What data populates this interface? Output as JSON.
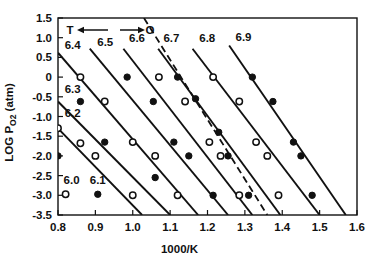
{
  "figure": {
    "name": "log-po2-vs-inverse-temperature-plot",
    "background": "#ffffff",
    "ink_color": "#111111"
  },
  "annotation": {
    "left_label": "T",
    "right_label": "O",
    "left_arrow_icon": "arrow-left-icon",
    "right_arrow_icon": "arrow-right-icon"
  },
  "legend": {
    "open_marker_label": "6.0",
    "filled_marker_label": "6.1",
    "open_marker_icon": "open-circle-marker",
    "filled_marker_icon": "filled-circle-marker"
  },
  "chart_data": {
    "type": "scatter",
    "title": "",
    "xlabel": "1000/K",
    "ylabel": "LOG PO2 (atm)",
    "xlim": [
      0.8,
      1.6
    ],
    "ylim": [
      -3.5,
      1.5
    ],
    "xticks": [
      "0.8",
      "0.9",
      "1.0",
      "1.1",
      "1.2",
      "1.3",
      "1.4",
      "1.5",
      "1.6"
    ],
    "xtick_values": [
      0.8,
      0.9,
      1.0,
      1.1,
      1.2,
      1.3,
      1.4,
      1.5,
      1.6
    ],
    "yticks": [
      "1.5",
      "1.0",
      "0.5",
      "0",
      "-0.5",
      "-1.0",
      "-1.5",
      "-2.0",
      "-2.5",
      "-3.0",
      "-3.5"
    ],
    "ytick_values": [
      1.5,
      1.0,
      0.5,
      0.0,
      -0.5,
      -1.0,
      -1.5,
      -2.0,
      -2.5,
      -3.0,
      -3.5
    ],
    "grid": false,
    "legend_position": "bottom-left-inside",
    "series": [
      {
        "name": "6.0",
        "label": "6.0",
        "label_x": 0.815,
        "label_y": -2.72,
        "label_anchor": "start",
        "style": "legend-only",
        "marker": "open",
        "line": "none",
        "points": []
      },
      {
        "name": "6.1",
        "label": "6.1",
        "label_x": 0.885,
        "label_y": -2.72,
        "label_anchor": "start",
        "style": "legend-only",
        "marker": "filled",
        "line": "none",
        "points": []
      },
      {
        "name": "6.2",
        "label": "6.2",
        "label_x": 0.818,
        "label_y": -1.02,
        "label_anchor": "start",
        "style": "solid",
        "marker": "open",
        "line": {
          "x1": 0.8,
          "y1": -1.3,
          "x2": 1.025,
          "y2": -3.5
        },
        "points": [
          {
            "x": 0.8,
            "y": -1.3,
            "marker": "open"
          },
          {
            "x": 0.86,
            "y": -1.68,
            "marker": "open"
          },
          {
            "x": 0.9,
            "y": -2.0,
            "marker": "open"
          },
          {
            "x": 1.0,
            "y": -3.0,
            "marker": "open"
          }
        ]
      },
      {
        "name": "6.3",
        "label": "6.3",
        "label_x": 0.818,
        "label_y": -0.4,
        "label_anchor": "start",
        "style": "solid",
        "marker": "filled",
        "line": {
          "x1": 0.8,
          "y1": -0.62,
          "x2": 1.1,
          "y2": -3.5
        },
        "points": [
          {
            "x": 0.8,
            "y": -2.0,
            "marker": "filled"
          },
          {
            "x": 0.86,
            "y": -0.62,
            "marker": "filled"
          },
          {
            "x": 0.925,
            "y": -1.65,
            "marker": "filled"
          },
          {
            "x": 1.06,
            "y": -2.55,
            "marker": "filled"
          }
        ]
      },
      {
        "name": "6.4",
        "label": "6.4",
        "label_x": 0.818,
        "label_y": 0.72,
        "label_anchor": "start",
        "style": "solid",
        "marker": "open",
        "line": {
          "x1": 0.8,
          "y1": 0.62,
          "x2": 1.175,
          "y2": -3.5
        },
        "points": [
          {
            "x": 0.86,
            "y": 0.0,
            "marker": "open"
          },
          {
            "x": 0.925,
            "y": -0.62,
            "marker": "open"
          },
          {
            "x": 1.0,
            "y": -1.65,
            "marker": "open"
          },
          {
            "x": 1.06,
            "y": -2.0,
            "marker": "open"
          },
          {
            "x": 1.12,
            "y": -3.0,
            "marker": "open"
          }
        ]
      },
      {
        "name": "6.5",
        "label": "6.5",
        "label_x": 0.905,
        "label_y": 0.8,
        "label_anchor": "start",
        "style": "solid",
        "marker": "filled",
        "line": {
          "x1": 0.885,
          "y1": 0.72,
          "x2": 1.255,
          "y2": -3.5
        },
        "points": [
          {
            "x": 0.985,
            "y": 0.0,
            "marker": "filled"
          },
          {
            "x": 1.055,
            "y": -0.62,
            "marker": "filled"
          },
          {
            "x": 1.11,
            "y": -1.65,
            "marker": "filled"
          },
          {
            "x": 1.15,
            "y": -2.0,
            "marker": "filled"
          },
          {
            "x": 1.215,
            "y": -3.0,
            "marker": "filled"
          }
        ]
      },
      {
        "name": "6.6",
        "label": "6.6",
        "label_x": 0.99,
        "label_y": 0.88,
        "label_anchor": "start",
        "style": "solid",
        "marker": "open",
        "line": {
          "x1": 0.975,
          "y1": 0.72,
          "x2": 1.32,
          "y2": -3.5
        },
        "points": [
          {
            "x": 1.07,
            "y": 0.0,
            "marker": "open"
          },
          {
            "x": 1.14,
            "y": -0.62,
            "marker": "open"
          },
          {
            "x": 1.205,
            "y": -1.65,
            "marker": "open"
          },
          {
            "x": 1.235,
            "y": -2.0,
            "marker": "open"
          },
          {
            "x": 1.285,
            "y": -3.0,
            "marker": "open"
          }
        ]
      },
      {
        "name": "6.7",
        "label": "6.7",
        "label_x": 1.082,
        "label_y": 0.88,
        "label_anchor": "start",
        "style": "solid",
        "marker": "filled",
        "line": {
          "x1": 1.068,
          "y1": 0.72,
          "x2": 1.395,
          "y2": -3.5
        },
        "points": [
          {
            "x": 1.12,
            "y": 0.0,
            "marker": "filled"
          },
          {
            "x": 1.168,
            "y": -0.55,
            "marker": "filled"
          },
          {
            "x": 1.23,
            "y": -1.4,
            "marker": "filled"
          },
          {
            "x": 1.255,
            "y": -2.0,
            "marker": "filled"
          },
          {
            "x": 1.31,
            "y": -3.0,
            "marker": "filled"
          }
        ]
      },
      {
        "name": "6.8",
        "label": "6.8",
        "label_x": 1.178,
        "label_y": 0.88,
        "label_anchor": "start",
        "style": "solid",
        "marker": "open",
        "line": {
          "x1": 1.16,
          "y1": 0.72,
          "x2": 1.5,
          "y2": -3.5
        },
        "points": [
          {
            "x": 1.215,
            "y": 0.0,
            "marker": "open"
          },
          {
            "x": 1.285,
            "y": -0.62,
            "marker": "open"
          },
          {
            "x": 1.33,
            "y": -1.65,
            "marker": "open"
          },
          {
            "x": 1.36,
            "y": -2.0,
            "marker": "open"
          },
          {
            "x": 1.39,
            "y": -3.0,
            "marker": "open"
          }
        ]
      },
      {
        "name": "6.9",
        "label": "6.9",
        "label_x": 1.275,
        "label_y": 0.92,
        "label_anchor": "start",
        "style": "solid",
        "marker": "filled",
        "line": {
          "x1": 1.258,
          "y1": 0.8,
          "x2": 1.57,
          "y2": -3.5
        },
        "points": [
          {
            "x": 1.32,
            "y": 0.0,
            "marker": "filled"
          },
          {
            "x": 1.375,
            "y": -0.62,
            "marker": "filled"
          },
          {
            "x": 1.43,
            "y": -1.65,
            "marker": "filled"
          },
          {
            "x": 1.45,
            "y": -2.0,
            "marker": "filled"
          },
          {
            "x": 1.48,
            "y": -3.0,
            "marker": "filled"
          }
        ]
      },
      {
        "name": "dashed-boundary",
        "label": "",
        "style": "dashed",
        "marker": "none",
        "line": {
          "x1": 1.03,
          "y1": 1.5,
          "x2": 1.36,
          "y2": -3.5
        },
        "points": []
      }
    ]
  }
}
